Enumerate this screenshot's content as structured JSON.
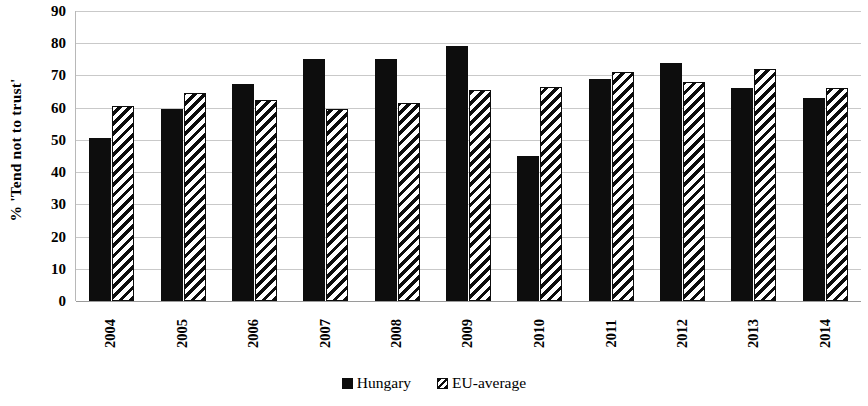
{
  "chart_data": {
    "type": "bar",
    "title": "",
    "subtitle": "",
    "xlabel": "",
    "ylabel": "% 'Tend not to trust'",
    "ylim": [
      0,
      90
    ],
    "ytick_step": 10,
    "yticks": [
      90,
      80,
      70,
      60,
      50,
      40,
      30,
      20,
      10,
      0
    ],
    "grid": true,
    "legend_position": "bottom-center",
    "categories": [
      "2004",
      "2005",
      "2006",
      "2007",
      "2008",
      "2009",
      "2010",
      "2011",
      "2012",
      "2013",
      "2014"
    ],
    "series": [
      {
        "name": "Hungary",
        "style": "solid-black",
        "color": "#0d0d0d",
        "values": [
          50.5,
          59.5,
          67.5,
          75,
          75,
          79,
          45,
          69,
          74,
          66,
          63
        ]
      },
      {
        "name": "EU-average",
        "style": "diagonal-hatch",
        "color": "#0d0d0d",
        "values": [
          60.5,
          64.5,
          62.5,
          59.5,
          61.5,
          65.5,
          66.5,
          71,
          68,
          72,
          66
        ]
      }
    ]
  },
  "legend": {
    "items": [
      {
        "label": "Hungary",
        "swatch": "solid-square-icon"
      },
      {
        "label": "EU-average",
        "swatch": "hatched-square-icon"
      }
    ]
  },
  "axes": {
    "y_title": "% 'Tend not to trust'"
  }
}
